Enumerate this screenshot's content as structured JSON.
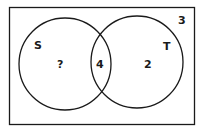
{
  "diagram": {
    "type": "venn",
    "universe": {
      "label": "",
      "outside_value": "3"
    },
    "sets": [
      {
        "name": "S",
        "only_value": "?"
      },
      {
        "name": "T",
        "only_value": "2"
      }
    ],
    "intersection_value": "4",
    "colors": {
      "stroke": "#1a1a1a",
      "background": "#ffffff"
    }
  }
}
